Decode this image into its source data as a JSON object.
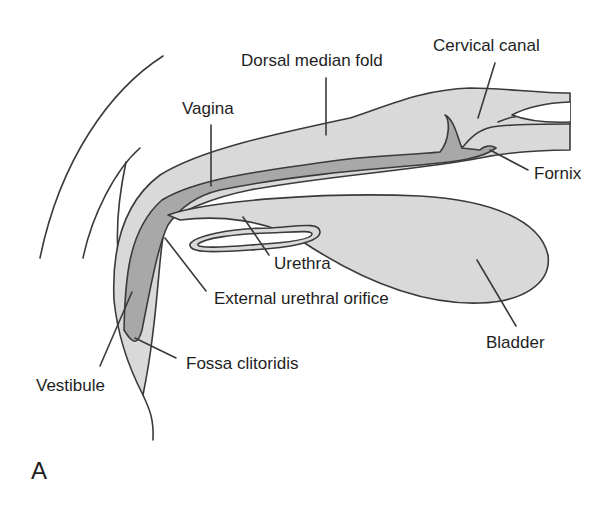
{
  "figure": {
    "panel_letter": "A",
    "labels": {
      "dorsal_median_fold": "Dorsal median fold",
      "cervical_canal": "Cervical canal",
      "vagina": "Vagina",
      "fornix": "Fornix",
      "urethra": "Urethra",
      "external_urethral_orifice": "External urethral orifice",
      "bladder": "Bladder",
      "fossa_clitoridis": "Fossa clitoridis",
      "vestibule": "Vestibule"
    },
    "colors": {
      "outline": "#3a3a3a",
      "light_tissue": "#d9d9d9",
      "dark_lumen": "#a8a8a8",
      "background": "#ffffff"
    }
  }
}
